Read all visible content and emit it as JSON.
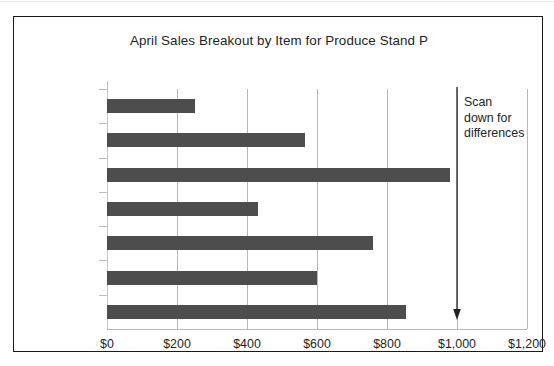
{
  "chart_data": {
    "type": "bar",
    "orientation": "horizontal",
    "title": "April Sales Breakout by Item for Produce Stand P",
    "xlabel": "",
    "ylabel": "",
    "categories": [
      "Carrots",
      "Tomatoes",
      "Potatoes",
      "Lettuce",
      "Oranges",
      "Bananas",
      "Apples"
    ],
    "values": [
      250,
      565,
      980,
      430,
      760,
      600,
      855
    ],
    "xlim": [
      0,
      1200
    ],
    "xticks": [
      0,
      200,
      400,
      600,
      800,
      1000,
      1200
    ],
    "xtick_labels": [
      "$0",
      "$200",
      "$400",
      "$600",
      "$800",
      "$1,000",
      "$1,200"
    ],
    "grid": "vertical",
    "legend": "none",
    "bar_color": "#4d4d4d",
    "annotations": [
      {
        "text_lines": [
          "Scan",
          "down for",
          "differences"
        ],
        "arrow": "down-arrow",
        "at_value": 1000
      }
    ]
  },
  "figure": {
    "border_color": "#1a1a1a",
    "background": "#ffffff",
    "gridline_color": "#b7b7b7",
    "axis_color": "#bdbdbd",
    "text_color": "#231f20"
  }
}
